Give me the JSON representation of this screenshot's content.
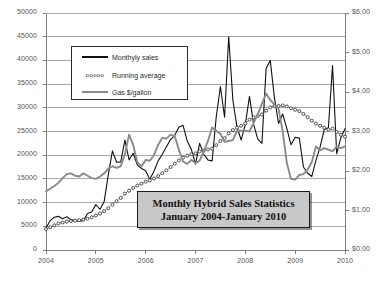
{
  "chart_data": {
    "type": "line",
    "title": "Monthly Hybrid Sales Statistics",
    "subtitle": "January 2004-January 2010",
    "xlabel": "",
    "ylabel": "",
    "grid": true,
    "legend_position": "upper-left-inside",
    "x": [
      "2004-01",
      "2004-02",
      "2004-03",
      "2004-04",
      "2004-05",
      "2004-06",
      "2004-07",
      "2004-08",
      "2004-09",
      "2004-10",
      "2004-11",
      "2004-12",
      "2005-01",
      "2005-02",
      "2005-03",
      "2005-04",
      "2005-05",
      "2005-06",
      "2005-07",
      "2005-08",
      "2005-09",
      "2005-10",
      "2005-11",
      "2005-12",
      "2006-01",
      "2006-02",
      "2006-03",
      "2006-04",
      "2006-05",
      "2006-06",
      "2006-07",
      "2006-08",
      "2006-09",
      "2006-10",
      "2006-11",
      "2006-12",
      "2007-01",
      "2007-02",
      "2007-03",
      "2007-04",
      "2007-05",
      "2007-06",
      "2007-07",
      "2007-08",
      "2007-09",
      "2007-10",
      "2007-11",
      "2007-12",
      "2008-01",
      "2008-02",
      "2008-03",
      "2008-04",
      "2008-05",
      "2008-06",
      "2008-07",
      "2008-08",
      "2008-09",
      "2008-10",
      "2008-11",
      "2008-12",
      "2009-01",
      "2009-02",
      "2009-03",
      "2009-04",
      "2009-05",
      "2009-06",
      "2009-07",
      "2009-08",
      "2009-09",
      "2009-10",
      "2009-11",
      "2009-12",
      "2010-01"
    ],
    "xticks": [
      "2004",
      "2005",
      "2006",
      "2007",
      "2008",
      "2009",
      "2010"
    ],
    "axes": [
      {
        "side": "left",
        "label": "units",
        "min": 0,
        "max": 50000,
        "step": 5000,
        "ticks": [
          "0",
          "5000",
          "10000",
          "15000",
          "20000",
          "25000",
          "30000",
          "35000",
          "40000",
          "45000",
          "50000"
        ]
      },
      {
        "side": "right",
        "label": "gas price",
        "min": 0,
        "max": 6,
        "step": 1,
        "ticks": [
          "$0,00",
          "$1,00",
          "$2,00",
          "$3,00",
          "$4,00",
          "$5,00",
          "$6,00"
        ]
      }
    ],
    "series": [
      {
        "name": "Monthyly sales",
        "axis": "left",
        "style": "solid-thin-black",
        "color": "#111111",
        "values": [
          4600,
          6200,
          6900,
          7100,
          6600,
          7000,
          6400,
          6200,
          6100,
          6200,
          7700,
          8000,
          9600,
          8600,
          10200,
          15900,
          20900,
          18500,
          18600,
          23200,
          19000,
          20400,
          17900,
          17200,
          16700,
          14900,
          16600,
          18800,
          20200,
          21800,
          23300,
          24200,
          25900,
          26300,
          23000,
          21200,
          18100,
          22500,
          20200,
          19000,
          18800,
          28100,
          34500,
          28000,
          45000,
          31600,
          25900,
          23200,
          26500,
          32400,
          26500,
          23400,
          22500,
          38300,
          40000,
          32200,
          26700,
          28700,
          25600,
          22200,
          23800,
          23600,
          17500,
          16200,
          15500,
          18900,
          21700,
          25400,
          25800,
          38900,
          20300,
          23700,
          25600
        ]
      },
      {
        "name": "Running average",
        "axis": "left",
        "style": "open-circles",
        "color": "#2b2b2b",
        "values": [
          4400,
          4800,
          5200,
          5600,
          5800,
          6000,
          6100,
          6200,
          6300,
          6400,
          6600,
          6900,
          7300,
          7700,
          8200,
          8800,
          9600,
          10300,
          11000,
          11900,
          12500,
          13100,
          13600,
          14000,
          14400,
          14700,
          15100,
          15600,
          16200,
          16800,
          17500,
          18200,
          18900,
          19500,
          19900,
          20200,
          20400,
          20800,
          21000,
          21200,
          21400,
          22100,
          23000,
          23600,
          24600,
          25300,
          25800,
          26200,
          26700,
          27500,
          28000,
          28300,
          28600,
          29400,
          30100,
          30400,
          30400,
          30500,
          30300,
          29900,
          29600,
          29300,
          28700,
          28000,
          27300,
          26700,
          26200,
          25800,
          25400,
          25600,
          24900,
          24300,
          23900
        ]
      },
      {
        "name": "Gas $/gallon",
        "axis": "right",
        "style": "solid-thick-gray",
        "color": "#8a8a8a",
        "values": [
          1.48,
          1.55,
          1.62,
          1.7,
          1.82,
          1.92,
          1.94,
          1.88,
          1.86,
          1.94,
          1.88,
          1.82,
          1.8,
          1.86,
          1.94,
          2.06,
          2.12,
          2.08,
          2.12,
          2.42,
          2.92,
          2.66,
          2.22,
          2.12,
          2.28,
          2.26,
          2.4,
          2.66,
          2.84,
          2.82,
          2.92,
          2.88,
          2.54,
          2.24,
          2.18,
          2.28,
          2.2,
          2.26,
          2.5,
          2.76,
          3.1,
          3.02,
          2.94,
          2.74,
          2.76,
          2.78,
          3.02,
          3.02,
          3.02,
          3.0,
          3.22,
          3.44,
          3.7,
          3.96,
          3.8,
          3.68,
          3.58,
          3.0,
          2.2,
          1.8,
          1.78,
          1.9,
          1.92,
          2.04,
          2.22,
          2.62,
          2.52,
          2.58,
          2.54,
          2.5,
          2.62,
          2.58,
          2.62
        ]
      }
    ]
  },
  "legend": {
    "items": [
      {
        "label": "Monthyly sales",
        "key": "solid-line"
      },
      {
        "label": "Running average",
        "key": "circles",
        "glyph": "ooooo"
      },
      {
        "label": "Gas $/gallon",
        "key": "gray-line"
      }
    ]
  }
}
